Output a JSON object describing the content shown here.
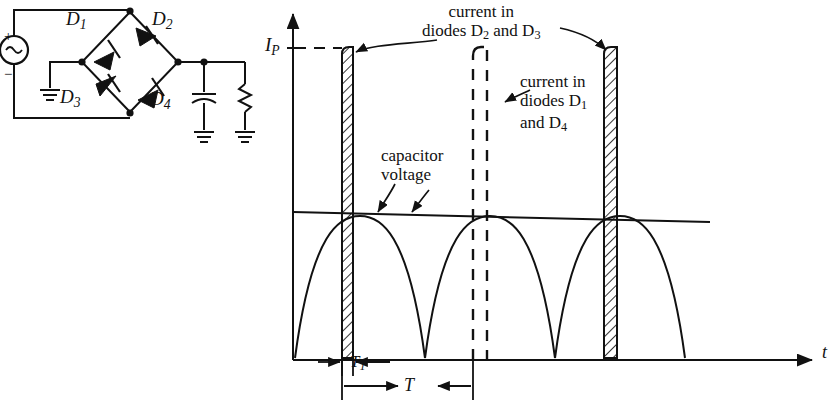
{
  "circuit": {
    "name": "full-wave bridge rectifier with capacitor filter",
    "source": {
      "type": "ac-source",
      "plus": "+",
      "minus": "−"
    },
    "diodes": [
      {
        "id": "D1",
        "label": "D",
        "sub": "1"
      },
      {
        "id": "D2",
        "label": "D",
        "sub": "2"
      },
      {
        "id": "D3",
        "label": "D",
        "sub": "3"
      },
      {
        "id": "D4",
        "label": "D",
        "sub": "4"
      }
    ],
    "output_components": [
      "capacitor",
      "resistor"
    ],
    "grounds": 3
  },
  "plot": {
    "y_axis_label": "I",
    "y_axis_label_sub": "P",
    "x_axis_label": "t",
    "annotations": [
      {
        "id": "current-d2-d3",
        "line1": "current in",
        "line2": "diodes D",
        "sub2": "2",
        "mid": " and D",
        "sub3": "3"
      },
      {
        "id": "current-d1-d4",
        "line1": "current in",
        "line2": "diodes D",
        "sub2": "1",
        "line3": "and D",
        "sub3": "4"
      },
      {
        "id": "capacitor-voltage",
        "line1": "capacitor",
        "line2": "voltage"
      }
    ],
    "dimensions": [
      {
        "id": "T1",
        "label": "T",
        "sub": "1"
      },
      {
        "id": "T",
        "label": "T",
        "sub": ""
      }
    ]
  },
  "chart_data": {
    "type": "line",
    "title": "",
    "xlabel": "t",
    "ylabel": "I_P",
    "grid": false,
    "legend": "annotations",
    "xlim": [
      0,
      1
    ],
    "ylim": [
      0,
      1
    ],
    "series": [
      {
        "name": "current in diodes D2 and D3",
        "style": "hatched-pulse",
        "description": "narrow tall current pulses, peak amplitude I_P, width T1, repeating every 2T",
        "pulses": [
          {
            "t_start": 0.108,
            "t_end": 0.125,
            "amplitude": 1.0
          },
          {
            "t_start": 0.492,
            "t_end": 0.512,
            "amplitude": 1.0
          }
        ]
      },
      {
        "name": "current in diodes D1 and D4",
        "style": "dashed-pulse",
        "description": "narrow tall current pulses interleaved halfway between the hatched pulses",
        "pulses": [
          {
            "t_start": 0.301,
            "t_end": 0.327,
            "amplitude": 1.0
          }
        ]
      },
      {
        "name": "capacitor voltage",
        "style": "solid-slow-ripple",
        "description": "nearly flat slightly decreasing ripple line riding on the peaks of the rectified sine humps",
        "values": [
          0.53,
          0.515,
          0.5
        ]
      },
      {
        "name": "rectified sine humps",
        "style": "solid-sine",
        "description": "full-wave rectified sinusoid, zero crossings at the pulse starts, peaks coincide with the pulse right edges",
        "peaks_t": [
          0.125,
          0.327,
          0.512
        ],
        "zeros_t": [
          0.042,
          0.226,
          0.41,
          0.59
        ]
      }
    ],
    "measurements": [
      {
        "label": "T1",
        "meaning": "conduction (pulse) width"
      },
      {
        "label": "T",
        "meaning": "period between successive conduction pulses"
      },
      {
        "label": "I_P",
        "meaning": "peak diode current"
      }
    ]
  }
}
